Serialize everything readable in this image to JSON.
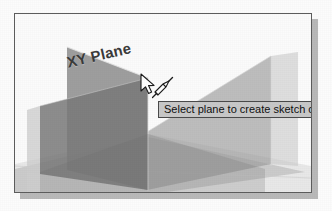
{
  "viewport": {
    "name": "3d-model-viewport",
    "background_color": "#fbfbfb",
    "border_color": "#5d5d5d"
  },
  "labels": {
    "xy_plane": "XY Plane"
  },
  "tooltip": {
    "text": "Select plane to create sketch or",
    "background_color": "#c8c8c8",
    "border_color": "#4a4a4a",
    "text_color": "#101010",
    "clipped": "true"
  },
  "cursor": {
    "icon": "arrow-pointer-with-sketch-pencil",
    "x": "124",
    "y": "59"
  },
  "planes": [
    {
      "name": "XY Plane",
      "orientation": "vertical-left",
      "fill": "#8d8d8d",
      "opacity": "0.80",
      "highlighted": "true"
    },
    {
      "name": "YZ Plane",
      "orientation": "vertical-right",
      "fill": "#a9a9a9",
      "opacity": "0.70",
      "highlighted": "false"
    },
    {
      "name": "XZ Plane",
      "orientation": "horizontal-ground",
      "fill": "#b5b5b5",
      "opacity": "0.55",
      "highlighted": "false"
    }
  ],
  "colors": {
    "plane_dark": "#7a7a7a",
    "plane_mid": "#9a9a9a",
    "plane_light": "#cfcfcf",
    "frame_shadow": "#b9b9b9",
    "page_background": "#fcfcfc"
  }
}
